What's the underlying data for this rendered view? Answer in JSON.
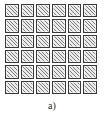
{
  "figure": {
    "caption": "a)",
    "grid": {
      "rows": 6,
      "columns": 6,
      "cell_count": 36,
      "cell_fill": "diagonal-hatch",
      "hatch_direction": "bottom-left-to-top-right",
      "border_color": "#3a3a3a",
      "hatch_color": "#7c7c7c",
      "cell_background": "#eceaea",
      "page_background": "#ffffff"
    },
    "cells": [
      [
        {
          "id": "r1c1",
          "fill": "hatched"
        },
        {
          "id": "r1c2",
          "fill": "hatched"
        },
        {
          "id": "r1c3",
          "fill": "hatched"
        },
        {
          "id": "r1c4",
          "fill": "hatched"
        },
        {
          "id": "r1c5",
          "fill": "hatched"
        },
        {
          "id": "r1c6",
          "fill": "hatched"
        }
      ],
      [
        {
          "id": "r2c1",
          "fill": "hatched"
        },
        {
          "id": "r2c2",
          "fill": "hatched"
        },
        {
          "id": "r2c3",
          "fill": "hatched"
        },
        {
          "id": "r2c4",
          "fill": "hatched"
        },
        {
          "id": "r2c5",
          "fill": "hatched"
        },
        {
          "id": "r2c6",
          "fill": "hatched"
        }
      ],
      [
        {
          "id": "r3c1",
          "fill": "hatched"
        },
        {
          "id": "r3c2",
          "fill": "hatched"
        },
        {
          "id": "r3c3",
          "fill": "hatched"
        },
        {
          "id": "r3c4",
          "fill": "hatched"
        },
        {
          "id": "r3c5",
          "fill": "hatched"
        },
        {
          "id": "r3c6",
          "fill": "hatched"
        }
      ],
      [
        {
          "id": "r4c1",
          "fill": "hatched"
        },
        {
          "id": "r4c2",
          "fill": "hatched"
        },
        {
          "id": "r4c3",
          "fill": "hatched"
        },
        {
          "id": "r4c4",
          "fill": "hatched"
        },
        {
          "id": "r4c5",
          "fill": "hatched"
        },
        {
          "id": "r4c6",
          "fill": "hatched"
        }
      ],
      [
        {
          "id": "r5c1",
          "fill": "hatched"
        },
        {
          "id": "r5c2",
          "fill": "hatched"
        },
        {
          "id": "r5c3",
          "fill": "hatched"
        },
        {
          "id": "r5c4",
          "fill": "hatched"
        },
        {
          "id": "r5c5",
          "fill": "hatched"
        },
        {
          "id": "r5c6",
          "fill": "hatched"
        }
      ],
      [
        {
          "id": "r6c1",
          "fill": "hatched"
        },
        {
          "id": "r6c2",
          "fill": "hatched"
        },
        {
          "id": "r6c3",
          "fill": "hatched"
        },
        {
          "id": "r6c4",
          "fill": "hatched"
        },
        {
          "id": "r6c5",
          "fill": "hatched"
        },
        {
          "id": "r6c6",
          "fill": "hatched"
        }
      ]
    ]
  }
}
